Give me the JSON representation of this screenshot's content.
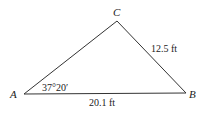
{
  "diagram": {
    "type": "triangle",
    "vertices": {
      "A": {
        "label": "A",
        "x": 24,
        "y": 94
      },
      "B": {
        "label": "B",
        "x": 186,
        "y": 93
      },
      "C": {
        "label": "C",
        "x": 117,
        "y": 21
      }
    },
    "sides": {
      "AB": {
        "label": "20.1 ft"
      },
      "BC": {
        "label": "12.5 ft"
      }
    },
    "angles": {
      "A": {
        "label": "37°20′"
      }
    },
    "colors": {
      "stroke": "#333333",
      "text": "#222222",
      "background": "#ffffff"
    }
  }
}
